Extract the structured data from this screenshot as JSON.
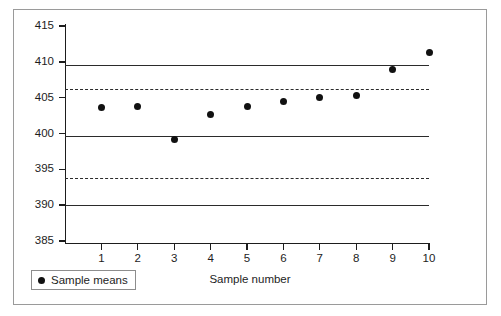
{
  "chart_data": {
    "type": "scatter",
    "title": "",
    "xlabel": "Sample number",
    "ylabel": "",
    "x": [
      1,
      2,
      3,
      4,
      5,
      6,
      7,
      8,
      9,
      10
    ],
    "categories": [
      "1",
      "2",
      "3",
      "4",
      "5",
      "6",
      "7",
      "8",
      "9",
      "10"
    ],
    "series": [
      {
        "name": "Sample means",
        "values": [
          403.6,
          403.8,
          399.2,
          402.6,
          403.7,
          404.4,
          405.0,
          405.3,
          408.9,
          411.3
        ]
      }
    ],
    "ylim": [
      385,
      415
    ],
    "xlim": [
      0,
      10.6
    ],
    "yticks": [
      385,
      390,
      395,
      400,
      405,
      410,
      415
    ],
    "ytick_labels": [
      "385",
      "390",
      "395",
      "400",
      "405",
      "410",
      "415"
    ],
    "xticks": [
      1,
      2,
      3,
      4,
      5,
      6,
      7,
      8,
      9,
      10
    ],
    "xtick_labels": [
      "1",
      "2",
      "3",
      "4",
      "5",
      "6",
      "7",
      "8",
      "9",
      "10"
    ],
    "grid": false,
    "legend_position": "bottom-left",
    "reference_lines": [
      {
        "name": "upper-control-limit",
        "value": 409.5,
        "style": "solid"
      },
      {
        "name": "upper-warning-limit",
        "value": 406.2,
        "style": "dashed"
      },
      {
        "name": "lower-warning-upper-band",
        "value": 399.7,
        "style": "solid"
      },
      {
        "name": "lower-warning-limit",
        "value": 393.8,
        "style": "dashed"
      },
      {
        "name": "lower-control-limit",
        "value": 390.0,
        "style": "solid"
      }
    ],
    "colors": {
      "marker": "#111111",
      "line": "#2b2b2b",
      "axis": "#1d1d1d",
      "frame": "#9a9a9a",
      "background": "#ffffff"
    }
  },
  "legend": {
    "label": "Sample means"
  },
  "axes": {
    "x_title": "Sample number"
  }
}
